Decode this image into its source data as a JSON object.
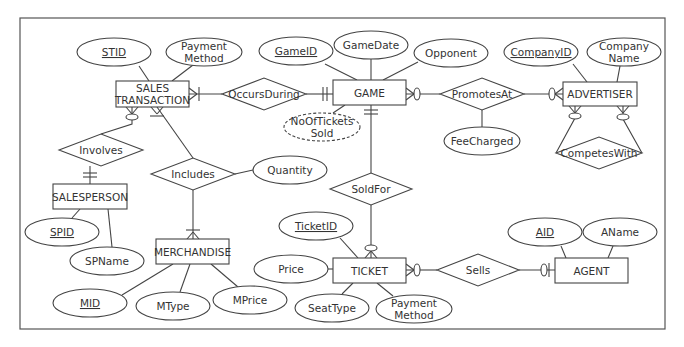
{
  "diagram": {
    "type": "ER diagram (crow's foot)",
    "frame": {
      "x": 20,
      "y": 18,
      "w": 645,
      "h": 311
    }
  },
  "entities": [
    {
      "id": "sales_transaction",
      "label": [
        "SALES",
        "TRANSACTION"
      ],
      "x": 116,
      "y": 81,
      "w": 73,
      "h": 26
    },
    {
      "id": "game",
      "label": [
        "GAME"
      ],
      "x": 333,
      "y": 80,
      "w": 73,
      "h": 25
    },
    {
      "id": "advertiser",
      "label": [
        "ADVERTISER"
      ],
      "x": 563,
      "y": 82,
      "w": 74,
      "h": 24
    },
    {
      "id": "salesperson",
      "label": [
        "SALESPERSON"
      ],
      "x": 53,
      "y": 184,
      "w": 74,
      "h": 25
    },
    {
      "id": "merchandise",
      "label": [
        "MERCHANDISE"
      ],
      "x": 156,
      "y": 239,
      "w": 73,
      "h": 25
    },
    {
      "id": "ticket",
      "label": [
        "TICKET"
      ],
      "x": 333,
      "y": 258,
      "w": 73,
      "h": 25
    },
    {
      "id": "agent",
      "label": [
        "AGENT"
      ],
      "x": 555,
      "y": 258,
      "w": 73,
      "h": 25
    }
  ],
  "relationships": [
    {
      "id": "occurs_during",
      "label": "OccursDuring",
      "cx": 264,
      "cy": 94,
      "hw": 42,
      "hh": 16
    },
    {
      "id": "promotes_at",
      "label": "PromotesAt",
      "cx": 482,
      "cy": 94,
      "hw": 42,
      "hh": 16
    },
    {
      "id": "competes_with",
      "label": "CompetesWith",
      "cx": 599,
      "cy": 153,
      "hw": 43,
      "hh": 16
    },
    {
      "id": "involves",
      "label": "Involves",
      "cx": 101,
      "cy": 150,
      "hw": 42,
      "hh": 16
    },
    {
      "id": "includes",
      "label": "Includes",
      "cx": 193,
      "cy": 174,
      "hw": 42,
      "hh": 16
    },
    {
      "id": "sold_for",
      "label": "SoldFor",
      "cx": 371,
      "cy": 189,
      "hw": 41,
      "hh": 16
    },
    {
      "id": "sells",
      "label": "Sells",
      "cx": 478,
      "cy": 270,
      "hw": 41,
      "hh": 16
    }
  ],
  "attributes": [
    {
      "id": "stid",
      "label": [
        "STID"
      ],
      "key": true,
      "cx": 114,
      "cy": 52,
      "rx": 37,
      "ry": 14
    },
    {
      "id": "st_payment_method",
      "label": [
        "Payment",
        "Method"
      ],
      "cx": 204,
      "cy": 52,
      "rx": 38,
      "ry": 14
    },
    {
      "id": "game_id",
      "label": [
        "GameID"
      ],
      "key": true,
      "cx": 296,
      "cy": 51,
      "rx": 37,
      "ry": 14
    },
    {
      "id": "game_date",
      "label": [
        "GameDate"
      ],
      "cx": 371,
      "cy": 45,
      "rx": 37,
      "ry": 14
    },
    {
      "id": "opponent",
      "label": [
        "Opponent"
      ],
      "cx": 451,
      "cy": 53,
      "rx": 37,
      "ry": 14
    },
    {
      "id": "no_of_tickets_sold",
      "label": [
        "NoOfTickets",
        "Sold"
      ],
      "derived": true,
      "cx": 322,
      "cy": 127,
      "rx": 38,
      "ry": 14
    },
    {
      "id": "company_id",
      "label": [
        "CompanyID"
      ],
      "key": true,
      "cx": 541,
      "cy": 52,
      "rx": 37,
      "ry": 14
    },
    {
      "id": "company_name",
      "label": [
        "Company",
        "Name"
      ],
      "cx": 624,
      "cy": 52,
      "rx": 37,
      "ry": 14
    },
    {
      "id": "fee_charged",
      "label": [
        "FeeCharged"
      ],
      "cx": 482,
      "cy": 141,
      "rx": 38,
      "ry": 14
    },
    {
      "id": "quantity",
      "label": [
        "Quantity"
      ],
      "cx": 290,
      "cy": 170,
      "rx": 37,
      "ry": 14
    },
    {
      "id": "spid",
      "label": [
        "SPID"
      ],
      "key": true,
      "cx": 62,
      "cy": 232,
      "rx": 37,
      "ry": 14
    },
    {
      "id": "spname",
      "label": [
        "SPName"
      ],
      "cx": 107,
      "cy": 261,
      "rx": 37,
      "ry": 14
    },
    {
      "id": "mid",
      "label": [
        "MID"
      ],
      "key": true,
      "cx": 90,
      "cy": 303,
      "rx": 37,
      "ry": 14
    },
    {
      "id": "mtype",
      "label": [
        "MType"
      ],
      "cx": 173,
      "cy": 306,
      "rx": 37,
      "ry": 14
    },
    {
      "id": "mprice",
      "label": [
        "MPrice"
      ],
      "cx": 250,
      "cy": 300,
      "rx": 37,
      "ry": 14
    },
    {
      "id": "ticket_id",
      "label": [
        "TicketID"
      ],
      "key": true,
      "cx": 316,
      "cy": 226,
      "rx": 37,
      "ry": 14
    },
    {
      "id": "price",
      "label": [
        "Price"
      ],
      "cx": 291,
      "cy": 269,
      "rx": 37,
      "ry": 14
    },
    {
      "id": "seat_type",
      "label": [
        "SeatType"
      ],
      "cx": 332,
      "cy": 308,
      "rx": 37,
      "ry": 14
    },
    {
      "id": "ticket_payment_method",
      "label": [
        "Payment",
        "Method"
      ],
      "cx": 414,
      "cy": 309,
      "rx": 38,
      "ry": 14
    },
    {
      "id": "aid",
      "label": [
        "AID"
      ],
      "key": true,
      "cx": 545,
      "cy": 232,
      "rx": 37,
      "ry": 14
    },
    {
      "id": "aname",
      "label": [
        "AName"
      ],
      "cx": 620,
      "cy": 232,
      "rx": 37,
      "ry": 14
    }
  ],
  "connections": [
    {
      "from": [
        139,
        66
      ],
      "to": [
        149,
        81
      ]
    },
    {
      "from": [
        193,
        65
      ],
      "to": [
        172,
        81
      ]
    },
    {
      "from": [
        189,
        94
      ],
      "to": [
        222,
        94
      ]
    },
    {
      "from": [
        306,
        94
      ],
      "to": [
        333,
        94
      ]
    },
    {
      "from": [
        325,
        64
      ],
      "to": [
        357,
        80
      ]
    },
    {
      "from": [
        371,
        59
      ],
      "to": [
        371,
        80
      ]
    },
    {
      "from": [
        418,
        62
      ],
      "to": [
        383,
        80
      ]
    },
    {
      "from": [
        333,
        113
      ],
      "to": [
        345,
        105
      ]
    },
    {
      "from": [
        406,
        94
      ],
      "to": [
        440,
        94
      ]
    },
    {
      "from": [
        524,
        94
      ],
      "to": [
        563,
        94
      ]
    },
    {
      "from": [
        482,
        110
      ],
      "to": [
        482,
        127
      ]
    },
    {
      "from": [
        573,
        64
      ],
      "to": [
        587,
        82
      ]
    },
    {
      "from": [
        620,
        66
      ],
      "to": [
        617,
        82
      ]
    },
    {
      "from": [
        575,
        106
      ],
      "to": [
        575,
        118
      ],
      "to2": [
        556,
        153
      ]
    },
    {
      "from": [
        623,
        106
      ],
      "to": [
        623,
        119
      ],
      "to2": [
        642,
        153
      ]
    },
    {
      "from": [
        132,
        107
      ],
      "to": [
        132,
        124
      ],
      "to2": [
        101,
        134
      ]
    },
    {
      "from": [
        90,
        166
      ],
      "to": [
        90,
        184
      ]
    },
    {
      "from": [
        157,
        107
      ],
      "to": [
        193,
        158
      ]
    },
    {
      "from": [
        235,
        174
      ],
      "to": [
        253,
        170
      ]
    },
    {
      "from": [
        193,
        190
      ],
      "to": [
        193,
        239
      ]
    },
    {
      "from": [
        80,
        209
      ],
      "to": [
        72,
        218
      ]
    },
    {
      "from": [
        108,
        209
      ],
      "to": [
        112,
        247
      ]
    },
    {
      "from": [
        173,
        264
      ],
      "to": [
        122,
        295
      ]
    },
    {
      "from": [
        190,
        264
      ],
      "to": [
        180,
        292
      ]
    },
    {
      "from": [
        211,
        264
      ],
      "to": [
        238,
        287
      ]
    },
    {
      "from": [
        371,
        105
      ],
      "to": [
        371,
        173
      ]
    },
    {
      "from": [
        371,
        205
      ],
      "to": [
        371,
        258
      ]
    },
    {
      "from": [
        340,
        238
      ],
      "to": [
        358,
        258
      ]
    },
    {
      "from": [
        328,
        269
      ],
      "to": [
        333,
        269
      ]
    },
    {
      "from": [
        353,
        283
      ],
      "to": [
        342,
        294
      ]
    },
    {
      "from": [
        377,
        283
      ],
      "to": [
        393,
        296
      ]
    },
    {
      "from": [
        406,
        270
      ],
      "to": [
        437,
        270
      ]
    },
    {
      "from": [
        519,
        270
      ],
      "to": [
        555,
        270
      ]
    },
    {
      "from": [
        561,
        246
      ],
      "to": [
        566,
        258
      ]
    },
    {
      "from": [
        613,
        246
      ],
      "to": [
        608,
        258
      ]
    }
  ],
  "cardinalities": [
    {
      "at": "sales_transaction-right",
      "notation": "one-or-many"
    },
    {
      "at": "game-left",
      "notation": "one-and-only-one"
    },
    {
      "at": "game-right",
      "notation": "zero-or-many"
    },
    {
      "at": "advertiser-left",
      "notation": "zero-or-many"
    },
    {
      "at": "advertiser-bottom-left",
      "notation": "zero-or-many"
    },
    {
      "at": "advertiser-bottom-right",
      "notation": "zero-or-many"
    },
    {
      "at": "sales_transaction-bottom-left",
      "notation": "zero-or-many"
    },
    {
      "at": "sales_transaction-bottom-right",
      "notation": "one-or-many"
    },
    {
      "at": "salesperson-top",
      "notation": "one-and-only-one"
    },
    {
      "at": "merchandise-top",
      "notation": "one-or-many"
    },
    {
      "at": "game-bottom",
      "notation": "one-and-only-one"
    },
    {
      "at": "ticket-top",
      "notation": "zero-or-many"
    },
    {
      "at": "ticket-right",
      "notation": "zero-or-many"
    },
    {
      "at": "agent-left",
      "notation": "zero-or-one"
    }
  ]
}
